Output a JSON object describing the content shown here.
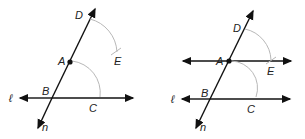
{
  "figures": [
    {
      "name": "step-1",
      "labels": {
        "D": "D",
        "A": "A",
        "E": "E",
        "B": "B",
        "C": "C",
        "l": "ℓ",
        "n": "n"
      }
    },
    {
      "name": "step-2",
      "labels": {
        "D": "D",
        "A": "A",
        "E": "E",
        "B": "B",
        "C": "C",
        "l": "ℓ",
        "n": "n"
      }
    }
  ],
  "colors": {
    "line": "#111111",
    "arc": "#b8b8b8"
  }
}
